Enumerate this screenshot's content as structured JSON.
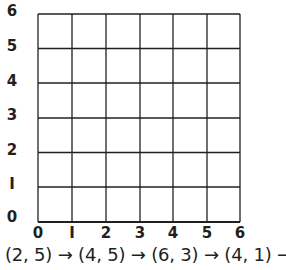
{
  "grid": {
    "x_min": 0,
    "x_max": 6,
    "y_min": 0,
    "y_max": 6,
    "line_color": "#231f20"
  },
  "y_labels": [
    "0",
    "I",
    "2",
    "3",
    "4",
    "5",
    "6"
  ],
  "x_labels": [
    "0",
    "I",
    "2",
    "3",
    "4",
    "5",
    "6"
  ],
  "path_text": "(2, 5) → (4, 5) → (6, 3) → (4, 1) →",
  "path_points": [
    [
      2,
      5
    ],
    [
      4,
      5
    ],
    [
      6,
      3
    ],
    [
      4,
      1
    ]
  ]
}
